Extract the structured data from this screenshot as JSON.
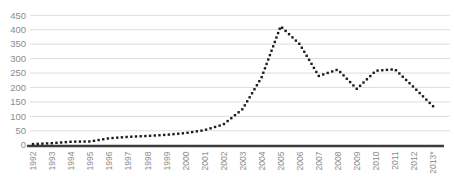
{
  "figure": {
    "width": 454,
    "height": 183,
    "background": "#ffffff"
  },
  "chart_data": {
    "type": "line",
    "line_style": "dotted",
    "title": "",
    "xlabel": "",
    "ylabel": "",
    "legend_position": "none",
    "grid": true,
    "ylim": [
      0,
      450
    ],
    "y_ticks": [
      0,
      50,
      100,
      150,
      200,
      250,
      300,
      350,
      400,
      450
    ],
    "categories": [
      "1992",
      "1993",
      "1994",
      "1995",
      "1996",
      "1997",
      "1998",
      "1999",
      "2000",
      "2001",
      "2002",
      "2003",
      "2004",
      "2005",
      "2006",
      "2007",
      "2008",
      "2009",
      "2010",
      "2011",
      "2012",
      "2013*"
    ],
    "series": [
      {
        "name": "annual-count",
        "values": [
          4,
          7,
          12,
          13,
          24,
          29,
          32,
          36,
          42,
          52,
          72,
          125,
          235,
          412,
          350,
          240,
          262,
          195,
          258,
          263,
          200,
          135
        ]
      }
    ],
    "colors": {
      "line": "#1b1b1b",
      "grid": "#dddddd",
      "axis": "#3c3c3c",
      "tick_text": "#8c8c8c",
      "background": "#ffffff"
    }
  }
}
